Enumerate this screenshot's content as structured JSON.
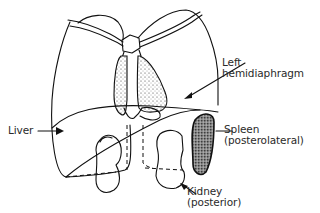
{
  "diagram": {
    "type": "anatomical line drawing",
    "labels": {
      "left_hemidiaphragm": {
        "line1": "Left",
        "line2": "hemidiaphragm"
      },
      "liver": {
        "line1": "Liver"
      },
      "spleen": {
        "line1": "Spleen",
        "line2": "(posterolateral)"
      },
      "kidney": {
        "line1": "Kidney",
        "line2": "(posterior)"
      }
    },
    "colors": {
      "line": "#111111",
      "text": "#2a2a2a",
      "background": "#ffffff"
    }
  }
}
